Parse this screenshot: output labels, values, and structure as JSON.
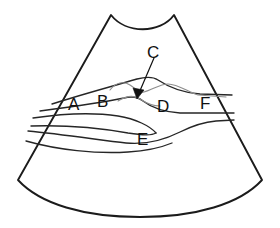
{
  "figure": {
    "type": "line-drawing",
    "width": 280,
    "height": 228,
    "background_color": "#ffffff",
    "outline_color": "#1b1b1b",
    "inner_line_color": "#262626",
    "faint_line_color": "#8d8d8d",
    "label_color": "#111111"
  },
  "labels": {
    "a": "A",
    "b": "B",
    "c": "C",
    "d": "D",
    "e": "E",
    "f": "F"
  },
  "label_positions": {
    "a": {
      "x": 68,
      "y": 96
    },
    "b": {
      "x": 97,
      "y": 93
    },
    "c": {
      "x": 147,
      "y": 44
    },
    "d": {
      "x": 157,
      "y": 98
    },
    "e": {
      "x": 137,
      "y": 131
    },
    "f": {
      "x": 200,
      "y": 95
    }
  },
  "annotation": {
    "leader_label": "C",
    "leader_from": {
      "x": 154,
      "y": 60
    },
    "leader_to": {
      "x": 137,
      "y": 95
    },
    "arrow_head": "filled-triangle"
  },
  "geometry": {
    "sector_apex_left": {
      "x": 110,
      "y": 14
    },
    "sector_apex_right": {
      "x": 175,
      "y": 14
    },
    "top_arc": "concave",
    "bottom_arc": "convex",
    "left_edge_bottom": {
      "x": 18,
      "y": 180
    },
    "right_edge_bottom": {
      "x": 262,
      "y": 180
    }
  }
}
